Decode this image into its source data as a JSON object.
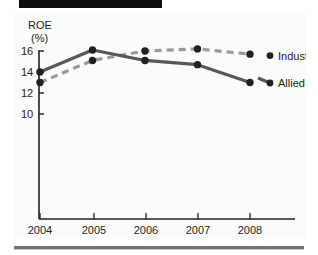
{
  "header": {
    "banner_color": "#0d0d0d"
  },
  "footer": {
    "rule_color": "#6e7276"
  },
  "chart_data": {
    "type": "line",
    "title": "",
    "ylabel": "ROE",
    "yunit": "(%)",
    "xlabel": "",
    "categories": [
      "2004",
      "2005",
      "2006",
      "2007",
      "2008"
    ],
    "ytick_labels": [
      "16",
      "14",
      "12",
      "10"
    ],
    "ytick_values": [
      16,
      14,
      12,
      10
    ],
    "ylim": [
      6.2,
      17.2
    ],
    "grid": false,
    "legend_position": "right-inline",
    "series": [
      {
        "name": "Industry",
        "values": [
          13.0,
          15.1,
          16.0,
          16.2,
          15.7
        ],
        "color": "#9a9a9a",
        "style": "dashed",
        "marker": "circle",
        "marker_color": "#231f20"
      },
      {
        "name": "Allied",
        "values": [
          14.0,
          16.1,
          15.1,
          14.7,
          13.0
        ],
        "color": "#58585b",
        "style": "solid",
        "marker": "circle",
        "marker_color": "#231f20"
      }
    ]
  }
}
